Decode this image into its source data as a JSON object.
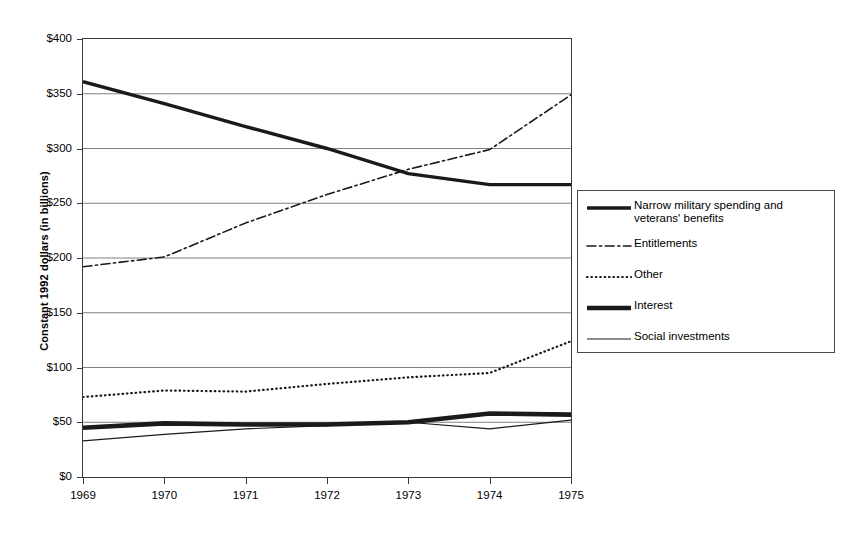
{
  "chart_data": {
    "type": "line",
    "title": "",
    "xlabel": "",
    "ylabel": "Constant 1992 dollars (in billions)",
    "x": [
      1969,
      1970,
      1971,
      1972,
      1973,
      1974,
      1975
    ],
    "categories": [
      "1969",
      "1970",
      "1971",
      "1972",
      "1973",
      "1974",
      "1975"
    ],
    "xtick_labels": [
      "1969",
      "1970",
      "1971",
      "1972",
      "1973",
      "1974",
      "1975"
    ],
    "ytick_labels": [
      "$0",
      "$50",
      "$100",
      "$150",
      "$200",
      "$250",
      "$300",
      "$350",
      "$400"
    ],
    "ytick_values": [
      0,
      50,
      100,
      150,
      200,
      250,
      300,
      350,
      400
    ],
    "ylim": [
      0,
      400
    ],
    "xlim": [
      1969,
      1975
    ],
    "grid": "horizontal",
    "legend_position": "right",
    "series": [
      {
        "name": "Narrow military spending and veterans' benefits",
        "style": "solid-thick",
        "color": "#1a1a1a",
        "values": [
          361,
          341,
          320,
          300,
          277,
          267,
          267
        ]
      },
      {
        "name": "Entitlements",
        "style": "dash-dot",
        "color": "#1a1a1a",
        "values": [
          192,
          201,
          232,
          258,
          281,
          299,
          349
        ]
      },
      {
        "name": "Other",
        "style": "dotted",
        "color": "#1a1a1a",
        "values": [
          73,
          79,
          78,
          85,
          91,
          95,
          124
        ]
      },
      {
        "name": "Interest",
        "style": "solid-extra-thick",
        "color": "#1a1a1a",
        "values": [
          45,
          49,
          48,
          48,
          50,
          58,
          57
        ]
      },
      {
        "name": "Social investments",
        "style": "solid-thin",
        "color": "#1a1a1a",
        "values": [
          33,
          39,
          44,
          47,
          50,
          44,
          52
        ]
      }
    ]
  },
  "axes": {
    "y_title": "Constant 1992 dollars (in billions)"
  },
  "legend": {
    "items": [
      {
        "label": "Narrow military spending and veterans' benefits",
        "style": "solid-thick"
      },
      {
        "label": "Entitlements",
        "style": "dash-dot"
      },
      {
        "label": "Other",
        "style": "dotted"
      },
      {
        "label": "Interest",
        "style": "solid-extra-thick"
      },
      {
        "label": "Social investments",
        "style": "solid-thin"
      }
    ]
  }
}
